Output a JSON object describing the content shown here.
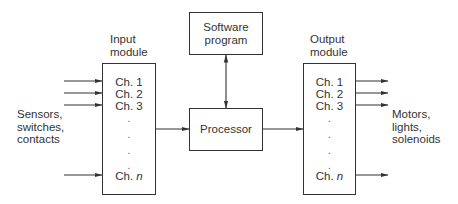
{
  "diagram": {
    "inputs_label": [
      "Sensors,",
      "switches,",
      "contacts"
    ],
    "outputs_label": [
      "Motors,",
      "lights,",
      "solenoids"
    ],
    "input_module": {
      "title": [
        "Input",
        "module"
      ],
      "channels": [
        "Ch. 1",
        "Ch. 2",
        "Ch. 3"
      ],
      "last_channel_prefix": "Ch.",
      "last_channel_var": "n",
      "dots": [
        ".",
        ".",
        ".",
        "."
      ]
    },
    "output_module": {
      "title": [
        "Output",
        "module"
      ],
      "channels": [
        "Ch. 1",
        "Ch. 2",
        "Ch. 3"
      ],
      "last_channel_prefix": "Ch.",
      "last_channel_var": "n",
      "dots": [
        ".",
        ".",
        ".",
        "."
      ]
    },
    "software_program": [
      "Software",
      "program"
    ],
    "processor": "Processor",
    "colors": {
      "line": "#333333",
      "background": "#ffffff"
    }
  }
}
